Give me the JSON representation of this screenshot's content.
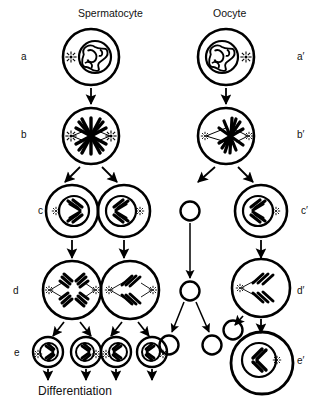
{
  "figure": {
    "title_left": "Spermatocyte",
    "title_right": "Oocyte",
    "footer_label": "Differentiation",
    "ink_color": "#000000",
    "background_color": "#ffffff"
  },
  "row_labels_left": [
    {
      "id": "a",
      "text": "a",
      "stage": "primary-cell-prophase"
    },
    {
      "id": "b",
      "text": "b",
      "stage": "metaphase-spindle"
    },
    {
      "id": "c",
      "text": "c",
      "stage": "secondary-cells"
    },
    {
      "id": "d",
      "text": "d",
      "stage": "second-division-anaphase"
    },
    {
      "id": "e",
      "text": "e",
      "stage": "gametes"
    }
  ],
  "row_labels_right": [
    {
      "id": "a-prime",
      "text": "a′",
      "stage": "primary-oocyte-prophase"
    },
    {
      "id": "b-prime",
      "text": "b′",
      "stage": "metaphase-asymmetric-spindle"
    },
    {
      "id": "c-prime",
      "text": "c′",
      "stage": "secondary-oocyte"
    },
    {
      "id": "d-prime",
      "text": "d′",
      "stage": "second-division"
    },
    {
      "id": "e-prime",
      "text": "e′",
      "stage": "mature-ovum"
    }
  ],
  "cells": {
    "spermatocyte_a": {
      "label": "primary spermatocyte",
      "contents": "tangled chromatin nucleus with one aster"
    },
    "spermatocyte_b": {
      "label": "spermatocyte metaphase",
      "contents": "central spindle with two asters"
    },
    "spermatocyte_c_left": {
      "label": "secondary spermatocyte left",
      "contents": "nucleus with chromosomes and aster"
    },
    "spermatocyte_c_right": {
      "label": "secondary spermatocyte right",
      "contents": "nucleus with chromosomes and aster"
    },
    "spermatocyte_d_left": {
      "label": "spermatocyte second division left",
      "contents": "two chromosome groups, two asters"
    },
    "spermatocyte_d_right": {
      "label": "spermatocyte second division right",
      "contents": "two chromosome groups, two asters"
    },
    "spermatids": [
      {
        "label": "spermatid 1"
      },
      {
        "label": "spermatid 2"
      },
      {
        "label": "spermatid 3"
      },
      {
        "label": "spermatid 4"
      }
    ],
    "oocyte_a": {
      "label": "primary oocyte",
      "contents": "tangled chromatin nucleus with one aster"
    },
    "oocyte_b": {
      "label": "oocyte metaphase",
      "contents": "eccentric spindle with two asters"
    },
    "oocyte_c": {
      "label": "secondary oocyte",
      "contents": "nucleus with chromosomes and aster"
    },
    "oocyte_d": {
      "label": "oocyte second division",
      "contents": "chromosome group with aster"
    },
    "ovum_e": {
      "label": "mature ovum",
      "contents": "nucleus with chromosome group and aster"
    },
    "polar_bodies": [
      {
        "label": "first polar body"
      },
      {
        "label": "polar body dividing"
      },
      {
        "label": "polar body product 1"
      },
      {
        "label": "polar body product 2"
      },
      {
        "label": "second polar body"
      }
    ]
  },
  "arrows": {
    "count": 19,
    "kinds": [
      "vertical-division-arrow",
      "branching-division-arrow",
      "differentiation-arrow"
    ]
  }
}
